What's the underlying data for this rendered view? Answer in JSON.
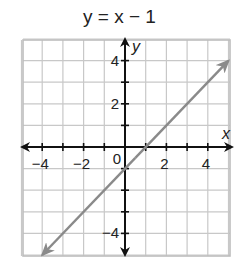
{
  "chart_data": {
    "type": "line",
    "title": "y = x − 1",
    "xlabel": "x",
    "ylabel": "y",
    "xlim": [
      -5,
      5
    ],
    "ylim": [
      -5,
      5
    ],
    "grid": true,
    "x_ticks": [
      -4,
      -2,
      0,
      2,
      4
    ],
    "x_tick_labels": [
      "−4",
      "−2",
      "0",
      "2",
      "4"
    ],
    "y_ticks": [
      4,
      2,
      -4
    ],
    "y_tick_labels": [
      "4",
      "2",
      "−4"
    ],
    "series": [
      {
        "name": "y = x − 1",
        "x": [
          -4,
          5
        ],
        "y": [
          -5,
          4
        ],
        "color": "#8a8a8a",
        "arrows": "both"
      }
    ],
    "colors": {
      "axis": "#111111",
      "grid": "#c8c8c8",
      "line": "#8a8a8a"
    }
  }
}
